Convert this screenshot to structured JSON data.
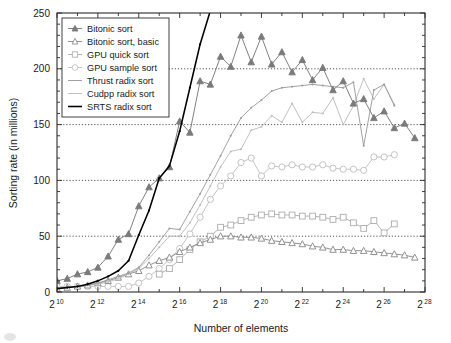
{
  "chart_data": {
    "type": "line",
    "title": "",
    "xlabel": "Number of elements",
    "ylabel": "Sorting rate (in millions)",
    "x_scale": "log2",
    "xlim": [
      10,
      28
    ],
    "ylim": [
      0,
      250
    ],
    "x_tick_labels": [
      "2^10",
      "2^12",
      "2^14",
      "2^16",
      "2^18",
      "2^20",
      "2^22",
      "2^24",
      "2^26",
      "2^28"
    ],
    "x_tick_bases": [
      "2",
      "2",
      "2",
      "2",
      "2",
      "2",
      "2",
      "2",
      "2",
      "2"
    ],
    "x_tick_exponents": [
      "10",
      "12",
      "14",
      "16",
      "18",
      "20",
      "22",
      "24",
      "26",
      "28"
    ],
    "x_tick_values": [
      10,
      12,
      14,
      16,
      18,
      20,
      22,
      24,
      26,
      28
    ],
    "y_tick_labels": [
      "0",
      "50",
      "100",
      "150",
      "200",
      "250"
    ],
    "y_tick_values": [
      0,
      50,
      100,
      150,
      200,
      250
    ],
    "grid": "horizontal-dotted-at-50-100-150-200",
    "legend_position": "top-left-inside",
    "series": [
      {
        "name": "Bitonic sort",
        "color": "#7a7a7a",
        "marker": "triangle-filled",
        "marker_filled": true,
        "x": [
          10,
          10.5,
          11,
          11.5,
          12,
          12.5,
          13,
          13.5,
          14,
          14.5,
          15,
          15.5,
          16,
          16.5,
          17,
          17.5,
          18,
          18.5,
          19,
          19.5,
          20,
          20.5,
          21,
          21.5,
          22,
          22.5,
          23,
          23.5,
          24,
          24.5,
          25,
          25.5,
          26,
          26.5,
          27,
          27.5
        ],
        "values": [
          10,
          12,
          16,
          18,
          22,
          32,
          47,
          52,
          77,
          94,
          102,
          112,
          153,
          143,
          189,
          186,
          211,
          202,
          230,
          206,
          229,
          204,
          215,
          197,
          208,
          190,
          201,
          181,
          189,
          169,
          173,
          156,
          162,
          147,
          151,
          138
        ]
      },
      {
        "name": "Bitonic sort, basic",
        "color": "#8c8c8c",
        "marker": "triangle-open",
        "marker_filled": false,
        "x": [
          10,
          10.5,
          11,
          11.5,
          12,
          12.5,
          13,
          13.5,
          14,
          14.5,
          15,
          15.5,
          16,
          16.5,
          17,
          17.5,
          18,
          18.5,
          19,
          19.5,
          20,
          20.5,
          21,
          21.5,
          22,
          22.5,
          23,
          23.5,
          24,
          24.5,
          25,
          25.5,
          26,
          26.5,
          27,
          27.5
        ],
        "values": [
          3,
          4,
          5,
          6,
          8,
          10,
          13,
          16,
          19,
          24,
          28,
          31,
          36,
          40,
          44,
          47,
          50,
          50,
          49,
          49,
          48,
          46,
          45,
          44,
          43,
          41,
          40,
          38,
          38,
          37,
          37,
          36,
          35,
          34,
          33,
          31
        ]
      },
      {
        "name": "GPU quick sort",
        "color": "#b0b0b0",
        "marker": "square-open",
        "marker_filled": false,
        "x": [
          15,
          15.5,
          16,
          16.5,
          17,
          17.5,
          18,
          18.5,
          19,
          19.5,
          20,
          20.5,
          21,
          21.5,
          22,
          22.5,
          23,
          23.5,
          24,
          24.5,
          25,
          25.5,
          26,
          26.5
        ],
        "values": [
          16,
          21,
          29,
          38,
          45,
          50,
          58,
          60,
          64,
          67,
          69,
          70,
          69,
          69,
          68,
          68,
          67,
          65,
          67,
          62,
          57,
          64,
          53,
          61
        ]
      },
      {
        "name": "GPU sample sort",
        "color": "#c0c0c0",
        "marker": "circle-open",
        "marker_filled": false,
        "x": [
          10,
          10.5,
          11,
          11.5,
          12,
          12.5,
          13,
          13.5,
          14,
          14.5,
          15,
          15.5,
          16,
          16.5,
          17,
          17.5,
          18,
          18.5,
          19,
          19.5,
          20,
          20.5,
          21,
          21.5,
          22,
          22.5,
          23,
          23.5,
          24,
          24.5,
          25,
          25.5,
          26,
          26.5
        ],
        "values": [
          5,
          5,
          5,
          5,
          5,
          5,
          5,
          5,
          8,
          14,
          21,
          29,
          39,
          52,
          67,
          83,
          95,
          104,
          116,
          120,
          104,
          113,
          112,
          114,
          112,
          112,
          114,
          111,
          110,
          110,
          109,
          121,
          121,
          123
        ]
      },
      {
        "name": "Thrust radix sort",
        "color": "#9c9c9c",
        "marker": "none",
        "marker_filled": false,
        "x": [
          10,
          10.5,
          11,
          11.5,
          12,
          12.5,
          13,
          13.5,
          14,
          14.5,
          15,
          15.5,
          16,
          16.5,
          17,
          17.5,
          18,
          18.5,
          19,
          19.5,
          20,
          20.5,
          21,
          21.5,
          22,
          22.5,
          23,
          23.5,
          24,
          24.5,
          25,
          25.5,
          26,
          26.5
        ],
        "values": [
          3,
          4,
          5,
          6,
          8,
          11,
          14,
          17,
          22,
          33,
          45,
          57,
          56,
          72,
          88,
          105,
          122,
          140,
          156,
          165,
          172,
          180,
          183,
          184,
          185,
          186,
          185,
          184,
          183,
          188,
          131,
          181,
          186,
          167
        ]
      },
      {
        "name": "Cudpp radix sort",
        "color": "#bdbdbd",
        "marker": "none",
        "marker_filled": false,
        "x": [
          10,
          10.5,
          11,
          11.5,
          12,
          12.5,
          13,
          13.5,
          14,
          14.5,
          15,
          15.5,
          16,
          16.5,
          17,
          17.5,
          18,
          18.5,
          19,
          19.5,
          20,
          20.5,
          21,
          21.5,
          22,
          22.5,
          23,
          23.5,
          24,
          24.5,
          25,
          25.5,
          26,
          26.5
        ],
        "values": [
          3,
          4,
          5,
          6,
          7,
          9,
          12,
          16,
          21,
          30,
          40,
          50,
          50,
          62,
          78,
          95,
          112,
          126,
          128,
          145,
          148,
          158,
          152,
          169,
          152,
          161,
          160,
          174,
          150,
          167,
          191,
          173,
          186,
          168
        ]
      },
      {
        "name": "SRTS radix sort",
        "color": "#000000",
        "marker": "none",
        "marker_filled": false,
        "x": [
          10,
          10.5,
          11,
          11.5,
          12,
          12.5,
          13,
          13.5,
          14,
          14.5,
          15,
          15.5,
          16,
          16.5,
          17,
          17.5,
          18
        ],
        "values": [
          3,
          4,
          5,
          7,
          10,
          14,
          19,
          28,
          51,
          73,
          102,
          113,
          144,
          183,
          222,
          252,
          290
        ]
      }
    ]
  },
  "axes": {
    "y_title": "Sorting rate (in millions)",
    "x_title": "Number of elements"
  },
  "legend": {
    "entries": [
      {
        "label": "Bitonic sort"
      },
      {
        "label": "Bitonic sort, basic"
      },
      {
        "label": "GPU quick sort"
      },
      {
        "label": "GPU sample sort"
      },
      {
        "label": "Thrust radix sort"
      },
      {
        "label": "Cudpp radix sort"
      },
      {
        "label": "SRTS radix sort"
      }
    ]
  }
}
